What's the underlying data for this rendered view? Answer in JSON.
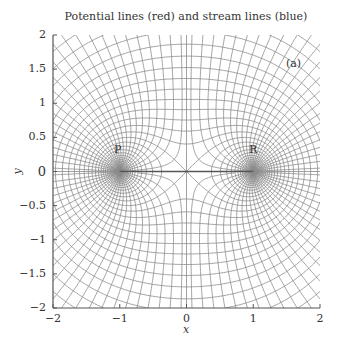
{
  "chart_data": {
    "type": "line",
    "title": "Potential lines (red) and stream lines (blue)",
    "xlabel": "x",
    "ylabel": "y",
    "xlim": [
      -2,
      2
    ],
    "ylim": [
      -2,
      2
    ],
    "x_ticks": [
      "−2",
      "−1",
      "0",
      "1",
      "2"
    ],
    "x_tick_values": [
      -2,
      -1,
      0,
      1,
      2
    ],
    "y_ticks": [
      "2",
      "1.5",
      "1",
      "0.5",
      "0",
      "−0.5",
      "−1",
      "−1.5",
      "−2"
    ],
    "y_tick_values": [
      2,
      1.5,
      1,
      0.5,
      0,
      -0.5,
      -1,
      -1.5,
      -2
    ],
    "panel_label": "(a)",
    "points": [
      {
        "label": "P",
        "x": -1,
        "y": 0
      },
      {
        "label": "R",
        "x": 1,
        "y": 0
      }
    ],
    "flow": {
      "description": "Two equal sources at P(-1,0) and R(1,0); complex potential w = log(z^2 - 1)",
      "potential_lines": "log|z^2-1| = const (Cassini ovals)",
      "stream_lines": "arg(z^2-1) = const",
      "potential_levels": {
        "start": -3.0,
        "end": 2.9,
        "step": 0.15
      },
      "stream_levels_count": 48
    },
    "grid": false,
    "legend": null
  },
  "colors": {
    "line": "#8a8a8a",
    "axis": "#555555",
    "emphasis": "#555555"
  }
}
